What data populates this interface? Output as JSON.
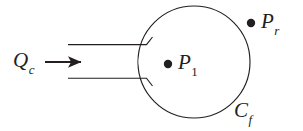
{
  "figure": {
    "background_color": "#ffffff",
    "stroke_color": "#231f20",
    "labels": {
      "inflow": {
        "base": "Q",
        "sub": "c",
        "name": "inflow-rate-label"
      },
      "center_point": {
        "base": "P",
        "sub": "1",
        "name": "center-pressure-label"
      },
      "right_point": {
        "base": "P",
        "sub": "r",
        "name": "right-pressure-label"
      },
      "boundary": {
        "base": "C",
        "sub": "f",
        "name": "fracture-boundary-label"
      }
    },
    "markers": [
      {
        "name": "center-point-dot",
        "label": "P1",
        "cx": 168,
        "cy": 64,
        "r": 4.2
      },
      {
        "name": "right-point-dot",
        "label": "Pr",
        "cx": 251,
        "cy": 23,
        "r": 4.2
      }
    ],
    "geometry": {
      "circle": {
        "cx": 194,
        "cy": 62,
        "r": 56
      },
      "channel": {
        "upper_wall_y": 45,
        "lower_wall_y": 78,
        "wall_x_start": 68,
        "wall_x_end": 148
      },
      "arrow": {
        "x_start": 45,
        "x_end": 84,
        "y": 62
      }
    }
  }
}
